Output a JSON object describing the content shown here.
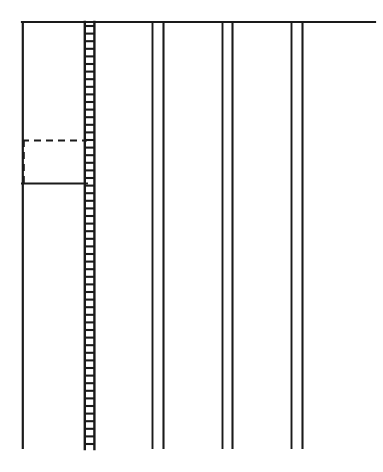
{
  "figure": {
    "type": "technical-line-drawing",
    "canvas": {
      "width": 383,
      "height": 472,
      "background": "#ffffff"
    },
    "stroke": {
      "color": "#1a1a1a",
      "thin_width": 1.6,
      "thick_width": 2.2
    },
    "top_rail": {
      "x1": 22,
      "x2": 375,
      "y": 22
    },
    "left_wall": {
      "x": 22,
      "y1": 22,
      "y2": 448
    },
    "hatched_column": {
      "label": "ladder-hatched-column",
      "x_left": 84,
      "x_right": 95,
      "y_top": 22,
      "y_bottom": 449,
      "rung_spacing": 7.6,
      "rung_count": 56
    },
    "line_pairs": [
      {
        "name": "pair-1",
        "x_left": 152,
        "x_right": 163,
        "y_top": 22,
        "y_bottom": 448
      },
      {
        "name": "pair-2",
        "x_left": 222,
        "x_right": 232,
        "y_top": 22,
        "y_bottom": 448
      },
      {
        "name": "pair-3",
        "x_left": 291,
        "x_right": 302,
        "y_top": 22,
        "y_bottom": 448
      }
    ],
    "inset_box": {
      "name": "dashed-inset-box",
      "x_left": 22,
      "x_right": 86,
      "y_top": 140,
      "y_bottom": 184,
      "top_edge_style": "dashed",
      "left_edge_style": "dashed",
      "bottom_edge_style": "solid",
      "right_edge_style": "none",
      "dash_pattern": "7,5"
    }
  }
}
